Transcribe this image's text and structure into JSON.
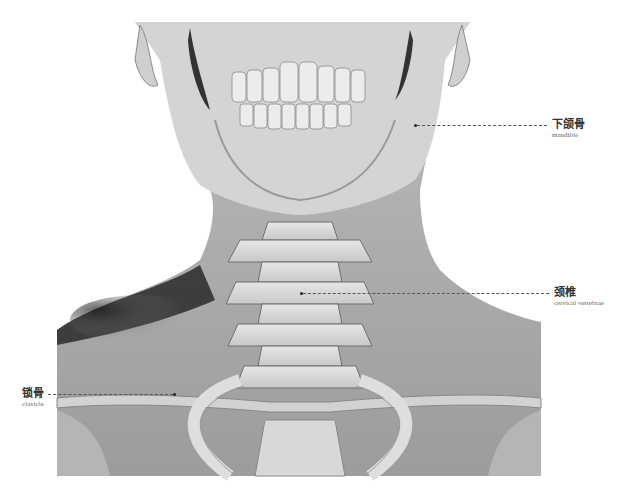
{
  "figure": {
    "labels": [
      {
        "id": "mandible",
        "zh": "下颌骨",
        "en": "mandible"
      },
      {
        "id": "cervical-vertebrae",
        "zh": "颈椎",
        "en": "cervical vertebrae"
      },
      {
        "id": "clavicle",
        "zh": "锁骨",
        "en": "clavicle"
      }
    ]
  }
}
